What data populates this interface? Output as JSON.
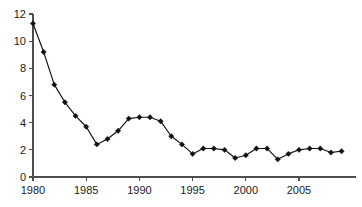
{
  "chart_data": {
    "type": "line",
    "title": "",
    "subtitle": "",
    "xlabel": "",
    "ylabel": "",
    "xlim": [
      1979.5,
      2009.5
    ],
    "ylim": [
      0,
      12
    ],
    "grid": false,
    "legend": null,
    "legend_position": "none",
    "marker": "diamond",
    "line_color": "#111111",
    "marker_color": "#111111",
    "axis_color": "#4d4d4d",
    "background_color": "#ffffff",
    "y_ticks": [
      0,
      2,
      4,
      6,
      8,
      10,
      12
    ],
    "y_tick_labels": [
      "0",
      "2",
      "4",
      "6",
      "8",
      "10",
      "12"
    ],
    "x_ticks": [
      1980,
      1985,
      1990,
      1995,
      2000,
      2005
    ],
    "x_tick_labels": [
      "1980",
      "1985",
      "1990",
      "1995",
      "2000",
      "2005"
    ],
    "x": [
      1980,
      1981,
      1982,
      1983,
      1984,
      1985,
      1986,
      1987,
      1988,
      1989,
      1990,
      1991,
      1992,
      1993,
      1994,
      1995,
      1996,
      1997,
      1998,
      1999,
      2000,
      2001,
      2002,
      2003,
      2004,
      2005,
      2006,
      2007,
      2008,
      2009
    ],
    "values": [
      11.3,
      9.2,
      6.8,
      5.5,
      4.5,
      3.7,
      2.4,
      2.8,
      3.4,
      4.3,
      4.4,
      4.4,
      4.1,
      3.0,
      2.4,
      1.7,
      2.1,
      2.1,
      2.0,
      1.4,
      1.6,
      2.1,
      2.1,
      1.3,
      1.7,
      2.0,
      2.1,
      2.1,
      1.8,
      1.9
    ],
    "series": [
      {
        "name": "series-1",
        "values": [
          11.3,
          9.2,
          6.8,
          5.5,
          4.5,
          3.7,
          2.4,
          2.8,
          3.4,
          4.3,
          4.4,
          4.4,
          4.1,
          3.0,
          2.4,
          1.7,
          2.1,
          2.1,
          2.0,
          1.4,
          1.6,
          2.1,
          2.1,
          1.3,
          1.7,
          2.0,
          2.1,
          2.1,
          1.8,
          1.9
        ]
      }
    ]
  }
}
